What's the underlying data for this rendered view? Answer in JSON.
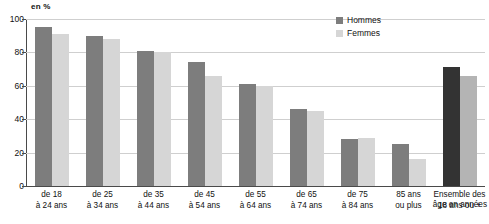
{
  "axis": {
    "unit_label": "en %",
    "y_ticks": [
      0,
      20,
      40,
      60,
      80,
      100
    ],
    "x_axis_title": "âge en années"
  },
  "legend": {
    "items": [
      {
        "label": "Hommes",
        "color": "#7d7d7d",
        "swatch_name": "legend-swatch-hommes"
      },
      {
        "label": "Femmes",
        "color": "#d6d6d6",
        "swatch_name": "legend-swatch-femmes"
      }
    ]
  },
  "chart_data": {
    "type": "bar",
    "title": "",
    "xlabel": "âge en années",
    "ylabel": "en %",
    "ylim": [
      0,
      100
    ],
    "y_ticks": [
      0,
      20,
      40,
      60,
      80,
      100
    ],
    "grid": true,
    "legend_position": "top-right",
    "categories": [
      "de 18 à 24 ans",
      "de 25 à 34 ans",
      "de 35 à 44 ans",
      "de 45 à 54 ans",
      "de 55 à 64 ans",
      "de 65 à 74 ans",
      "de 75 à 84 ans",
      "85 ans ou plus",
      "Ensemble des 18 ans ou +"
    ],
    "category_lines": [
      [
        "de 18",
        "à 24 ans"
      ],
      [
        "de 25",
        "à 34 ans"
      ],
      [
        "de 35",
        "à 44 ans"
      ],
      [
        "de 45",
        "à 54 ans"
      ],
      [
        "de 55",
        "à 64 ans"
      ],
      [
        "de 65",
        "à 74 ans"
      ],
      [
        "de 75",
        "à 84 ans"
      ],
      [
        "85 ans",
        "ou plus"
      ],
      [
        "Ensemble des",
        "18 ans ou +"
      ]
    ],
    "series": [
      {
        "name": "Hommes",
        "color": "#7d7d7d",
        "values": [
          95,
          90,
          81,
          74,
          61,
          46,
          28,
          25,
          71
        ]
      },
      {
        "name": "Femmes",
        "color": "#d6d6d6",
        "values": [
          91,
          88,
          80,
          66,
          60,
          45,
          29,
          16,
          66
        ]
      }
    ]
  }
}
